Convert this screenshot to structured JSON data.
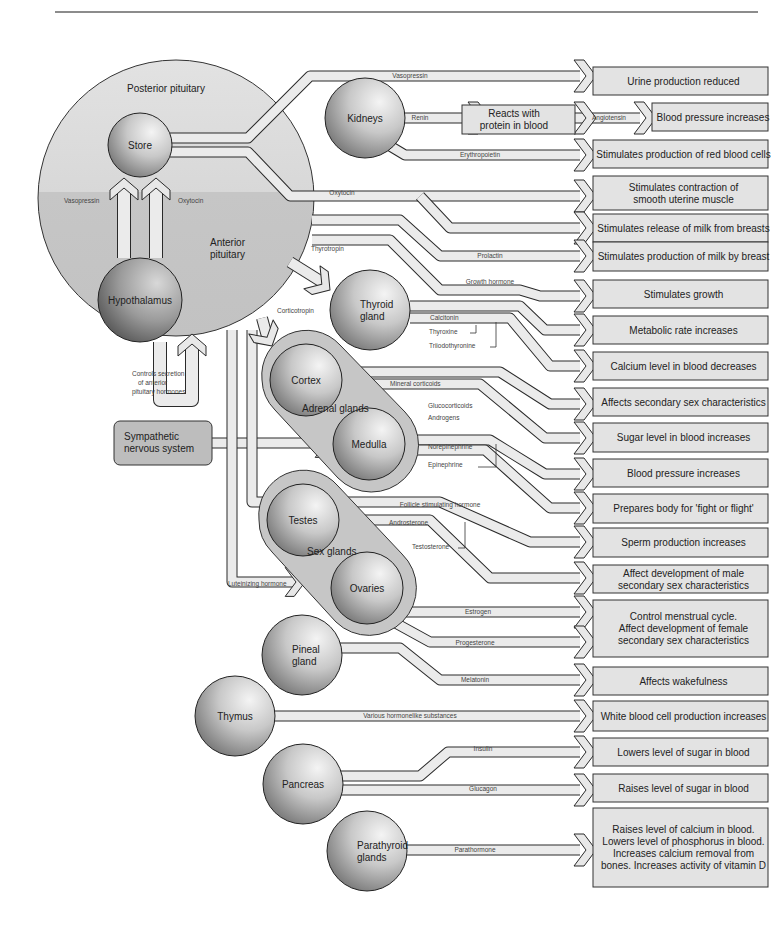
{
  "diagram": {
    "title_rule": {
      "x1": 55,
      "x2": 758,
      "y": 12,
      "color": "#555555"
    },
    "colors": {
      "box_fill": "#e3e3e3",
      "box_stroke": "#333333",
      "tube_fill": "#e8e8e8",
      "tube_stroke": "#2a2a2a",
      "pituitary_top": "#dedede",
      "pituitary_bottom": "#c9c9c9",
      "sphere_light": "#f2f2f2",
      "sphere_dark": "#6e6e6e",
      "gland_pad": "#c6c6c6",
      "sympathetic_fill": "#bdbdbd"
    },
    "pituitary": {
      "posterior_label": "Posterior pituitary",
      "anterior_label": "Anterior pituitary",
      "anterior_label_line1": "Anterior",
      "anterior_label_line2": "pituitary",
      "vasopressin_label": "Vasopressin",
      "oxytocin_label": "Oxytocin"
    },
    "organs": [
      {
        "id": "store",
        "label": "Store",
        "cx": 140,
        "cy": 145,
        "r": 32
      },
      {
        "id": "hypothalamus",
        "label": "Hypothalamus",
        "cx": 140,
        "cy": 300,
        "r": 42
      },
      {
        "id": "kidneys",
        "label": "Kidneys",
        "cx": 365,
        "cy": 118,
        "r": 40
      },
      {
        "id": "thyroid",
        "label_line1": "Thyroid",
        "label_line2": "gland",
        "cx": 370,
        "cy": 310,
        "r": 40
      },
      {
        "id": "cortex",
        "label": "Cortex",
        "cx": 306,
        "cy": 380,
        "r": 36
      },
      {
        "id": "medulla",
        "label": "Medulla",
        "cx": 369,
        "cy": 444,
        "r": 36
      },
      {
        "id": "testes",
        "label": "Testes",
        "cx": 303,
        "cy": 520,
        "r": 36
      },
      {
        "id": "ovaries",
        "label": "Ovaries",
        "cx": 367,
        "cy": 588,
        "r": 36
      },
      {
        "id": "pineal",
        "label_line1": "Pineal",
        "label_line2": "gland",
        "cx": 302,
        "cy": 655,
        "r": 40
      },
      {
        "id": "thymus",
        "label": "Thymus",
        "cx": 235,
        "cy": 716,
        "r": 40
      },
      {
        "id": "pancreas",
        "label": "Pancreas",
        "cx": 303,
        "cy": 784,
        "r": 40
      },
      {
        "id": "parathyroid",
        "label_line1": "Parathyroid",
        "label_line2": "glands",
        "cx": 367,
        "cy": 851,
        "r": 40
      }
    ],
    "group_labels": {
      "adrenal": "Adrenal glands",
      "sex": "Sex glands"
    },
    "controls_secretion": [
      "Controls secretion",
      "of anterior",
      "pituitary hormones"
    ],
    "sympathetic": {
      "line1": "Sympathetic",
      "line2": "nervous system"
    },
    "reacts_box": {
      "line1": "Reacts with",
      "line2": "protein in blood"
    },
    "hormones": {
      "vasopressin": "Vasopressin",
      "renin": "Renin",
      "angiotensin": "Angiotensin",
      "erythropoietin": "Erythropoietin",
      "oxytocin": "Oxytocin",
      "thyrotropin": "Thyrotropin",
      "prolactin": "Prolactin",
      "growth_hormone": "Growth hormone",
      "corticotropin": "Corticotropin",
      "calcitonin": "Calcitonin",
      "thyroxine": "Thyroxine",
      "triiodothyronine": "Triiodothyronine",
      "mineral_corticoids": "Mineral corticoids",
      "glucocorticoids": "Glucocorticoids",
      "androgens": "Androgens",
      "norepinephrine": "Norepinephrine",
      "epinephrine": "Epinephrine",
      "fsh": "Follicle stimulating hormone",
      "androsterone": "Androsterone",
      "testosterone": "Testosterone",
      "luteinizing": "Luteinizing hormone",
      "estrogen": "Estrogen",
      "progesterone": "Progesterone",
      "melatonin": "Melatonin",
      "various": "Various hormonelike substances",
      "insulin": "Insulin",
      "glucagon": "Glucagon",
      "parathormone": "Parathormone"
    },
    "effects": [
      {
        "y": 67,
        "h": 28,
        "lines": [
          "Urine production reduced"
        ]
      },
      {
        "y": 103,
        "h": 28,
        "x": 652,
        "lines": [
          "Blood pressure increases"
        ]
      },
      {
        "y": 140,
        "h": 28,
        "lines": [
          "Stimulates production of red blood cells"
        ]
      },
      {
        "y": 176,
        "h": 34,
        "lines": [
          "Stimulates contraction of",
          "smooth uterine muscle"
        ]
      },
      {
        "y": 214,
        "h": 28,
        "lines": [
          "Stimulates release of milk from breasts"
        ]
      },
      {
        "y": 242,
        "h": 29,
        "lines": [
          "Stimulates production of milk by breast"
        ]
      },
      {
        "y": 280,
        "h": 28,
        "lines": [
          "Stimulates growth"
        ]
      },
      {
        "y": 316,
        "h": 28,
        "lines": [
          "Metabolic rate increases"
        ]
      },
      {
        "y": 352,
        "h": 28,
        "lines": [
          "Calcium level in  blood decreases"
        ]
      },
      {
        "y": 388,
        "h": 28,
        "lines": [
          "Affects secondary sex characteristics"
        ]
      },
      {
        "y": 423,
        "h": 29,
        "lines": [
          "Sugar level in blood increases"
        ]
      },
      {
        "y": 459,
        "h": 28,
        "lines": [
          "Blood pressure increases"
        ]
      },
      {
        "y": 494,
        "h": 29,
        "lines": [
          "Prepares body for 'fight or flight'"
        ]
      },
      {
        "y": 528,
        "h": 29,
        "lines": [
          "Sperm production increases"
        ]
      },
      {
        "y": 565,
        "h": 28,
        "lines": [
          "Affect development of male",
          "secondary sex characteristics"
        ]
      },
      {
        "y": 600,
        "h": 57,
        "lines": [
          "Control menstrual cycle.",
          "Affect development  of  female",
          "secondary sex characteristics"
        ]
      },
      {
        "y": 667,
        "h": 28,
        "lines": [
          "Affects wakefulness"
        ]
      },
      {
        "y": 701,
        "h": 30,
        "lines": [
          "White blood cell production increases"
        ]
      },
      {
        "y": 738,
        "h": 28,
        "lines": [
          "Lowers level of sugar in blood"
        ]
      },
      {
        "y": 774,
        "h": 28,
        "lines": [
          "Raises level of sugar in blood"
        ]
      },
      {
        "y": 808,
        "h": 79,
        "lines": [
          "Raises level of calcium in blood.",
          "Lowers level of phosphorus in blood.",
          "Increases calcium removal from",
          "bones. Increases activity of vitamin D"
        ]
      }
    ]
  }
}
